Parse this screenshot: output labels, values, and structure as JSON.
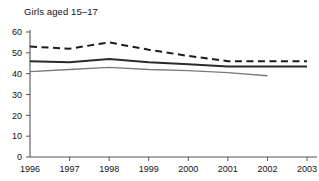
{
  "chart_data": {
    "type": "line",
    "title": "Girls aged 15–17",
    "xlabel": "",
    "ylabel": "",
    "x": [
      1996,
      1997,
      1998,
      1999,
      2000,
      2001,
      2002,
      2003
    ],
    "xtick_labels": [
      "1996",
      "1997",
      "1998",
      "1999",
      "2000",
      "2001",
      "2002",
      "2003"
    ],
    "ytick_labels": [
      "0",
      "10",
      "20",
      "30",
      "40",
      "50",
      "60"
    ],
    "yticks": [
      0,
      10,
      20,
      30,
      40,
      50,
      60
    ],
    "ylim": [
      0,
      60
    ],
    "xlim": [
      1996,
      2003
    ],
    "grid": false,
    "legend": "none",
    "series": [
      {
        "name": "dashed-upper",
        "style": "dashed",
        "color": "#1c1c1c",
        "values": [
          53,
          52,
          55,
          51.5,
          48.5,
          46,
          46,
          46
        ]
      },
      {
        "name": "solid-thick-middle",
        "style": "solid-thick",
        "color": "#2b2b2b",
        "values": [
          46,
          45.5,
          47,
          45.5,
          44.5,
          43.5,
          43.5,
          43.5
        ]
      },
      {
        "name": "solid-thin-lower",
        "style": "solid-thin",
        "color": "#7a7a7a",
        "values": [
          41,
          42,
          43,
          42,
          41.5,
          40.5,
          39,
          null
        ]
      }
    ]
  }
}
